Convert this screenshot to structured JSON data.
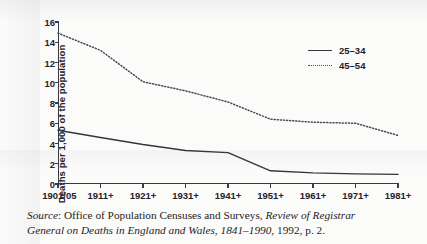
{
  "chart_data": {
    "type": "line",
    "title": "",
    "xlabel": "",
    "ylabel": "Deaths per 1,000 of the population",
    "categories": [
      "1901/05",
      "1911+",
      "1921+",
      "1931+",
      "1941+",
      "1951+",
      "1961+",
      "1971+",
      "1981+"
    ],
    "ylim": [
      0,
      16
    ],
    "yticks": [
      0,
      2,
      4,
      6,
      8,
      10,
      12,
      14,
      16
    ],
    "grid": false,
    "legend_position": "top-right",
    "series": [
      {
        "name": "25–34",
        "style": "solid",
        "color": "#35353f",
        "values": [
          5.3,
          4.6,
          3.9,
          3.3,
          3.1,
          1.3,
          1.1,
          1.0,
          0.95
        ]
      },
      {
        "name": "45–54",
        "style": "dotted",
        "color": "#4a4a56",
        "values": [
          14.9,
          13.2,
          10.1,
          9.2,
          8.1,
          6.4,
          6.1,
          6.0,
          4.8
        ]
      }
    ]
  },
  "legend": {
    "items": [
      {
        "label": "25–34"
      },
      {
        "label": "45–54"
      }
    ]
  },
  "source": {
    "prefix": "Source",
    "line1_a": ": Office of Population Censuses and Surveys, ",
    "line1_italic": "Review of Registrar",
    "line2_italic": "General on Deaths in England and Wales, 1841–1990",
    "line2_b": ", 1992, p. 2."
  }
}
